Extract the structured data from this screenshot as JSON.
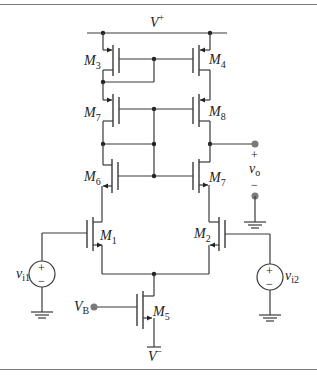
{
  "diagram": {
    "type": "circuit-schematic",
    "supply": {
      "positive": {
        "label": "V",
        "sup": "+"
      },
      "negative": {
        "label": "V",
        "sup": "−"
      }
    },
    "transistors": [
      {
        "id": "M1",
        "label": "M",
        "sub": "1",
        "type": "NMOS"
      },
      {
        "id": "M2",
        "label": "M",
        "sub": "2",
        "type": "NMOS"
      },
      {
        "id": "M3",
        "label": "M",
        "sub": "3",
        "type": "PMOS"
      },
      {
        "id": "M4",
        "label": "M",
        "sub": "4",
        "type": "PMOS"
      },
      {
        "id": "M5",
        "label": "M",
        "sub": "5",
        "type": "NMOS"
      },
      {
        "id": "M6",
        "label": "M",
        "sub": "6",
        "type": "NMOS"
      },
      {
        "id": "M7",
        "label": "M",
        "sub": "7",
        "type": "NMOS"
      },
      {
        "id": "M8",
        "label": "M",
        "sub": "8",
        "type": "PMOS"
      },
      {
        "id": "M9",
        "label": "M",
        "sub": "9",
        "type": "PMOS"
      }
    ],
    "sources": [
      {
        "id": "vi1",
        "label": "v",
        "sub": "i1",
        "plus": "+",
        "minus": "−"
      },
      {
        "id": "vi2",
        "label": "v",
        "sub": "i2",
        "plus": "+",
        "minus": "−"
      }
    ],
    "bias": {
      "label": "V",
      "sub": "B"
    },
    "output": {
      "label": "v",
      "sub": "o",
      "plus": "+",
      "minus": "−"
    }
  }
}
